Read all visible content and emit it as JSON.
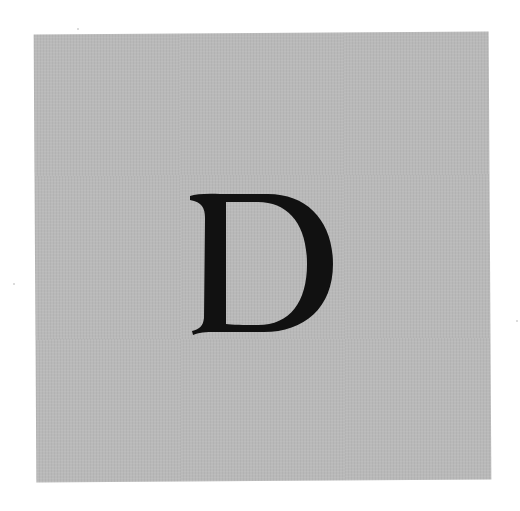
{
  "image": {
    "letter": "D",
    "background_color": "#ffffff",
    "card_color": "#b9b9b9",
    "letter_color": "#111111"
  }
}
